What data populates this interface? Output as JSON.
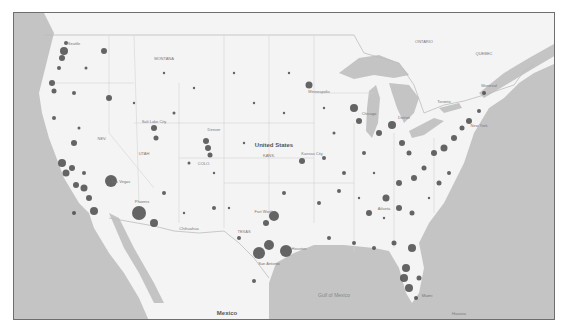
{
  "map": {
    "title": "United States symbol map",
    "colors": {
      "land": "#f4f4f4",
      "water": "#c4c4c4",
      "border": "#bdbdbd",
      "bubble": "#4a4a4a",
      "frame": "#6e6e6e"
    },
    "labels": {
      "country_us": "United States",
      "country_mexico": "Mexico",
      "gulf": "Gulf of Mexico",
      "canada_east": "ONTARIO",
      "quebec": "QUEBEC",
      "montana": "MONTANA",
      "nevada": "NEV.",
      "utah": "UTAH",
      "colorado": "COLO.",
      "kansas": "KANS.",
      "texas": "TEXAS",
      "kansas_city": "Kansas City",
      "denver": "Denver",
      "salt_lake": "Salt Lake City",
      "las_vegas": "Las Vegas",
      "phoenix": "Phoenix",
      "dallas": "Fort Worth",
      "houston": "Houston",
      "san_antonio": "San Antonio",
      "new_york": "New York",
      "chicago": "Chicago",
      "detroit": "Detroit",
      "atlanta": "Atlanta",
      "miami": "Miami",
      "havana": "Havana",
      "montreal": "Montreal",
      "toronto": "Toronto",
      "minneapolis": "Minneapolis",
      "seattle": "Seattle",
      "chihuahua": "Chihuahua"
    }
  }
}
